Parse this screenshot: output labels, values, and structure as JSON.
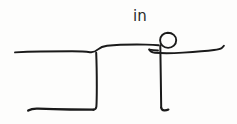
{
  "canvas": {
    "width": 237,
    "height": 124,
    "background_color": "#fdfdfc",
    "ink_color": "#1a1a1a",
    "medium": "hand-drawn ink sketch"
  },
  "annotation": {
    "label_text": "in",
    "label_x": 133,
    "label_y": 9,
    "label_color": "#2a2a2a"
  },
  "scene": {
    "description": "Hand drawn stick figure standing at the edge of a step or ledge with the handwritten word in above",
    "elements": [
      {
        "name": "upper-ledge-line",
        "type": "stroke",
        "label": "upper horizontal ledge surface",
        "start": [
          15,
          52
        ],
        "end": [
          160,
          45
        ]
      },
      {
        "name": "ledge-vertical-drop",
        "type": "stroke",
        "label": "vertical face of the step",
        "start": [
          96,
          53
        ],
        "end": [
          96,
          109
        ]
      },
      {
        "name": "lower-ground-line",
        "type": "stroke",
        "label": "lower horizontal ground line",
        "start": [
          28,
          110
        ],
        "end": [
          96,
          109
        ]
      },
      {
        "name": "figure-head",
        "type": "circle",
        "label": "stick figure head",
        "center": [
          168,
          40
        ],
        "radius": 7.5
      },
      {
        "name": "figure-body",
        "type": "stroke",
        "label": "stick figure body and leg",
        "start": [
          160,
          46
        ],
        "end": [
          161,
          110
        ]
      },
      {
        "name": "figure-arms",
        "type": "stroke",
        "label": "stick figure outstretched arms",
        "start": [
          149,
          50
        ],
        "end": [
          224,
          47
        ]
      },
      {
        "name": "figure-foot",
        "type": "stroke",
        "label": "stick figure foot hook",
        "start": [
          161,
          110
        ],
        "end": [
          168,
          109
        ]
      }
    ]
  },
  "stroke_paths": {
    "upper_ledge": "M 15,52.4 C 32,51.6 52,51.3 72,51.3 C 80,51.3 86,51.6 90,52.2 C 93.4,52.7 95.5,51.6 98,49.4 C 100.2,47.4 103,46.2 107,45.7 C 118,44.6 132,44.4 146,44.6 C 151,44.7 155,44.9 158.5,45.3",
    "ledge_drop": "M 96.2,52.8 C 96.6,62 96.8,74 96.8,86 C 96.8,95 96.7,102 96.4,106.5 C 96.2,108.6 95.3,109.6 93.3,109.7",
    "lower_ground": "M 28.2,110.6 C 31,108.9 34,108.4 38,108.6 C 46,109 58,109.4 70,109.5 C 79,109.6 87,109.6 93.5,109.7",
    "figure_head": "M 167.8,32.7 C 172.6,32.7 176.2,36 176.2,40.2 C 176.2,44.5 172.6,47.9 168.1,47.9 C 163.5,47.9 160.1,44.5 160.1,40.3 C 160.1,36.1 163.3,32.8 167.8,32.7 Z",
    "figure_body": "M 160.3,45.2 C 160.4,55 160.6,66 160.8,78 C 161,90 161.1,100 161.2,107.5",
    "figure_arms": "M 149.2,49.4 C 150,51.4 152,52.4 155,52.7 C 162,53.4 172,53.3 183,52.6 C 194,51.9 206,51 214,50 C 218,49.5 220.5,48.9 221.8,47.9 C 222.6,47.3 223.3,46.6 223.9,45.8",
    "figure_shoulder_hook": "M 149.4,49.6 C 152,50.1 155,50.4 158,50.5",
    "figure_foot": "M 161.2,107.6 C 161.5,109.4 162.4,110.3 164.2,110.4 C 165.8,110.5 167.2,110.2 168.4,109.6"
  }
}
